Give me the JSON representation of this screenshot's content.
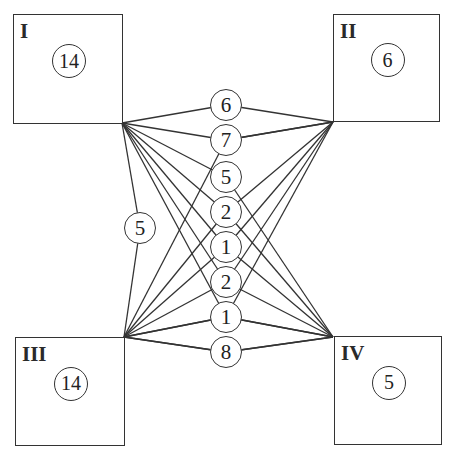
{
  "boxes": [
    {
      "id": "I",
      "label": "I",
      "count": "14",
      "x": 13,
      "y": 14,
      "w": 110,
      "h": 110
    },
    {
      "id": "II",
      "label": "II",
      "count": "6",
      "x": 333,
      "y": 14,
      "w": 107,
      "h": 108
    },
    {
      "id": "III",
      "label": "III",
      "count": "14",
      "x": 15,
      "y": 337,
      "w": 110,
      "h": 109
    },
    {
      "id": "IV",
      "label": "IV",
      "count": "5",
      "x": 334,
      "y": 336,
      "w": 108,
      "h": 109
    }
  ],
  "corners": {
    "I": [
      122,
      123
    ],
    "II": [
      333,
      122
    ],
    "III": [
      124,
      337
    ],
    "IV": [
      333,
      337
    ]
  },
  "nodes": [
    {
      "value": "6",
      "cx": 226,
      "cy": 105,
      "from": "I",
      "to": "II"
    },
    {
      "value": "7",
      "cx": 226,
      "cy": 140,
      "from": "I",
      "to": "II"
    },
    {
      "value": "5",
      "cx": 226,
      "cy": 177,
      "from": "I",
      "to": "IV"
    },
    {
      "value": "2",
      "cx": 226,
      "cy": 212,
      "from": "I",
      "to": "IV"
    },
    {
      "value": "1",
      "cx": 226,
      "cy": 247,
      "from": "I",
      "to": "IV"
    },
    {
      "value": "2",
      "cx": 226,
      "cy": 282,
      "from": "III",
      "to": "II"
    },
    {
      "value": "1",
      "cx": 226,
      "cy": 317,
      "from": "III",
      "to": "II"
    },
    {
      "value": "8",
      "cx": 226,
      "cy": 352,
      "from": "III",
      "to": "IV"
    }
  ],
  "side_node": {
    "value": "5",
    "cx": 140,
    "cy": 228,
    "from": "I",
    "to": "III"
  },
  "extra_edges": [
    [
      "III",
      "II",
      140
    ],
    [
      "III",
      "II",
      247
    ],
    [
      "III",
      "IV",
      317
    ],
    [
      "I",
      "IV",
      282
    ],
    [
      "III",
      "II",
      212
    ],
    [
      "I",
      "IV",
      317
    ],
    [
      "III",
      "IV",
      352
    ]
  ],
  "style": {
    "stroke": "#333333",
    "fill": "#ffffff"
  }
}
